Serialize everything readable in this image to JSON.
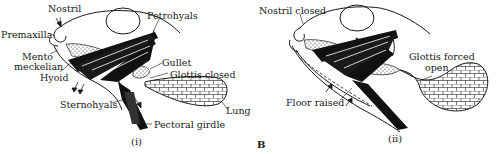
{
  "figure": {
    "letter": "B",
    "panels": [
      {
        "id": "i",
        "caption": "(i)",
        "labels": {
          "nostril": "Nostril",
          "premaxilla": "Premaxilla",
          "mento_meckelian_1": "Mento",
          "mento_meckelian_2": "meckelian",
          "hyoid": "Hyoid",
          "petrohyals": "Petrohyals",
          "gullet": "Gullet",
          "glottis": "Glottis closed",
          "sternohyals": "Sternohyals",
          "lung": "Lung",
          "pectoral_girdle": "Pectoral girdle"
        }
      },
      {
        "id": "ii",
        "caption": "(ii)",
        "labels": {
          "nostril": "Nostril closed",
          "glottis_1": "Glottis forced",
          "glottis_2": "open",
          "floor": "Floor raised"
        }
      }
    ]
  },
  "colors": {
    "ink": "#1a1a1a",
    "background": "#ffffff"
  }
}
